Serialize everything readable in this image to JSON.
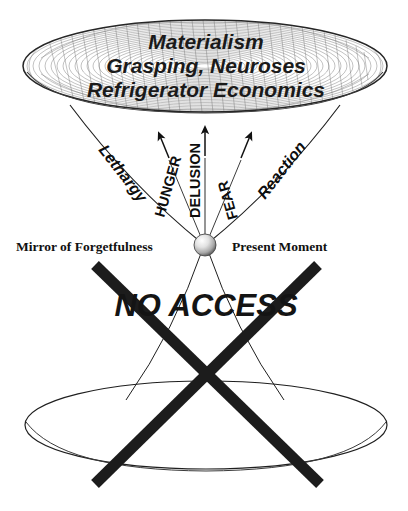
{
  "diagram": {
    "title_lines": [
      "Materialism",
      "Grasping, Neuroses",
      "Refrigerator Economics"
    ],
    "curve_labels": {
      "left": "Lethargy",
      "right": "Reaction"
    },
    "arrow_labels": [
      "HUNGER",
      "DELUSION",
      "FEAR"
    ],
    "center_labels": {
      "left": "Mirror of Forgetfulness",
      "right": "Present Moment"
    },
    "blocked_label": "NO ACCESS",
    "colors": {
      "ink": "#111111",
      "mesh": "#6b6b6b",
      "thin_line": "#2a2a2a",
      "cross": "#1c1c1c",
      "background": "#ffffff",
      "node_highlight": "#fcfcfc",
      "node_shadow": "#6e6e6e"
    }
  }
}
